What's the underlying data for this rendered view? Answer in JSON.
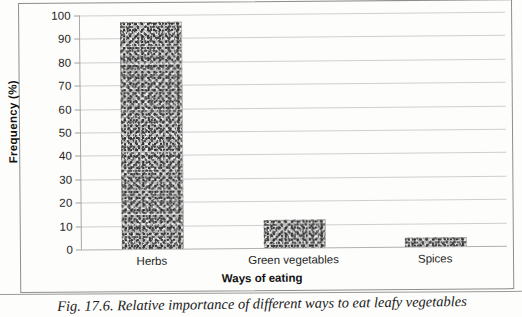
{
  "figure": {
    "caption": "Fig. 17.6. Relative importance of different ways to eat leafy vegetables",
    "frame_color": "#8d8d8d"
  },
  "chart_data": {
    "type": "bar",
    "title": "",
    "categories": [
      "Herbs",
      "Green vegetables",
      "Spices"
    ],
    "values": [
      97,
      12,
      4
    ],
    "xlabel": "Ways of eating",
    "ylabel": "Frequency (%)",
    "ylim": [
      0,
      100
    ],
    "ytick_labels": [
      "0",
      "10",
      "20",
      "30",
      "40",
      "50",
      "60",
      "70",
      "80",
      "90",
      "100"
    ],
    "ytick_values": [
      0,
      10,
      20,
      30,
      40,
      50,
      60,
      70,
      80,
      90,
      100
    ],
    "grid": true,
    "grid_axis": "y",
    "legend": "none",
    "bar_fill": "#b9b9b9",
    "gridline_color": "#cfcfcf",
    "axis_color": "#a8a8a8"
  }
}
